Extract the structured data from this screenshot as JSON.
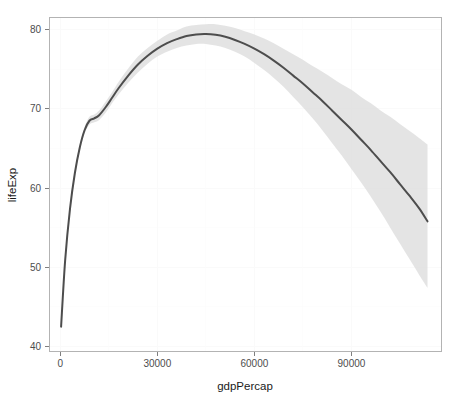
{
  "chart_data": {
    "type": "line",
    "title": "",
    "subtitle": "",
    "xlabel": "gdpPercap",
    "ylabel": "lifeExp",
    "xlim": [
      -3500,
      118000
    ],
    "ylim": [
      39.3,
      81.6
    ],
    "xticks": [
      0,
      30000,
      60000,
      90000
    ],
    "xtick_labels": [
      "0",
      "30000",
      "60000",
      "90000"
    ],
    "yticks": [
      40,
      50,
      60,
      70,
      80
    ],
    "ytick_labels": [
      "40",
      "50",
      "60",
      "70",
      "80"
    ],
    "grid": true,
    "legend": null,
    "legend_position": "none",
    "annotations": [],
    "series": [
      {
        "name": "loess-smooth",
        "kind": "line",
        "color": "#4d4d4d",
        "x": [
          241,
          1500,
          3000,
          4500,
          6000,
          7500,
          9000,
          10500,
          12000,
          14000,
          16000,
          18000,
          21000,
          24000,
          27000,
          30000,
          33000,
          36000,
          39000,
          42000,
          45000,
          48000,
          51000,
          54000,
          57000,
          60000,
          63000,
          66000,
          69000,
          72000,
          75000,
          78000,
          81000,
          84000,
          87000,
          90000,
          93000,
          96000,
          99000,
          102000,
          105000,
          108000,
          111000,
          113523
        ],
        "y": [
          42.5,
          50.9,
          57.4,
          61.9,
          65.1,
          67.3,
          68.5,
          68.8,
          69.2,
          70.2,
          71.4,
          72.6,
          74.2,
          75.6,
          76.7,
          77.6,
          78.3,
          78.8,
          79.2,
          79.4,
          79.45,
          79.35,
          79.1,
          78.7,
          78.2,
          77.6,
          76.9,
          76.1,
          75.2,
          74.2,
          73.2,
          72.1,
          71.0,
          69.8,
          68.6,
          67.4,
          66.1,
          64.8,
          63.4,
          62.0,
          60.5,
          59.0,
          57.4,
          55.8
        ]
      },
      {
        "name": "confidence-band",
        "kind": "ribbon",
        "color": "#d9d9d9",
        "x": [
          241,
          1500,
          3000,
          4500,
          6000,
          7500,
          9000,
          10500,
          12000,
          14000,
          16000,
          18000,
          21000,
          24000,
          27000,
          30000,
          33000,
          36000,
          39000,
          42000,
          45000,
          48000,
          51000,
          54000,
          57000,
          60000,
          63000,
          66000,
          69000,
          72000,
          75000,
          78000,
          81000,
          84000,
          87000,
          90000,
          93000,
          96000,
          99000,
          102000,
          105000,
          108000,
          111000,
          113523
        ],
        "ymin": [
          42.1,
          50.5,
          57.0,
          61.5,
          64.7,
          66.9,
          68.0,
          68.3,
          68.6,
          69.5,
          70.7,
          71.8,
          73.3,
          74.6,
          75.7,
          76.6,
          77.2,
          77.7,
          78.0,
          78.2,
          78.2,
          78.0,
          77.7,
          77.2,
          76.6,
          75.8,
          74.9,
          73.9,
          72.8,
          71.5,
          70.2,
          68.8,
          67.3,
          65.7,
          64.1,
          62.4,
          60.7,
          58.9,
          57.0,
          55.0,
          53.0,
          51.0,
          49.0,
          47.4
        ],
        "ymax": [
          42.9,
          51.3,
          57.8,
          62.3,
          65.5,
          67.7,
          69.0,
          69.3,
          69.8,
          70.9,
          72.1,
          73.4,
          75.1,
          76.6,
          77.7,
          78.6,
          79.4,
          79.9,
          80.4,
          80.6,
          80.7,
          80.7,
          80.5,
          80.2,
          79.8,
          79.4,
          78.9,
          78.3,
          77.6,
          76.9,
          76.2,
          75.4,
          74.7,
          73.9,
          73.1,
          72.4,
          71.5,
          70.7,
          69.8,
          69.0,
          68.1,
          67.2,
          66.3,
          65.5
        ]
      }
    ]
  },
  "axes": {
    "x_title": "gdpPercap",
    "y_title": "lifeExp"
  }
}
